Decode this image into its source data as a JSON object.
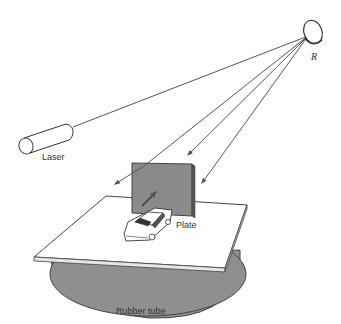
{
  "diagram": {
    "labels": {
      "mirror": "R",
      "laser": "Laser",
      "plate": "Plate",
      "base": "Rubber tube"
    },
    "colors": {
      "line": "#555555",
      "plate_fill": "#8a8a8a",
      "tube_fill": "#8f8f8f",
      "table_fill": "#ffffff"
    }
  }
}
